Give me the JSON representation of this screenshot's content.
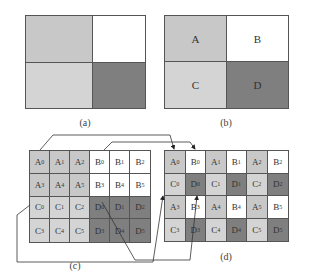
{
  "colors": {
    "A": "#c8c8c8",
    "B": "#ffffff",
    "C": "#d4d4d4",
    "D": "#7f7f7f",
    "border": "#555555"
  },
  "panel_a": {
    "caption": "(a)",
    "cells": [
      "",
      "",
      "",
      ""
    ],
    "types": [
      "A",
      "B",
      "C",
      "D"
    ]
  },
  "panel_b": {
    "caption": "(b)",
    "cells": [
      "A",
      "B",
      "C",
      "D"
    ],
    "types": [
      "A",
      "B",
      "C",
      "D"
    ]
  },
  "panel_c": {
    "caption": "(c)",
    "rows": [
      [
        "A0",
        "A1",
        "A2",
        "B0",
        "B1",
        "B2"
      ],
      [
        "A3",
        "A4",
        "A5",
        "B3",
        "B4",
        "B5"
      ],
      [
        "C0",
        "C1",
        "C2",
        "D0",
        "D1",
        "D2"
      ],
      [
        "C3",
        "C4",
        "C5",
        "D3",
        "D4",
        "D5"
      ]
    ]
  },
  "panel_d": {
    "caption": "(d)",
    "rows": [
      [
        "A0",
        "B0",
        "A1",
        "B1",
        "A2",
        "B2"
      ],
      [
        "C0",
        "D0",
        "C1",
        "D1",
        "C2",
        "D2"
      ],
      [
        "A3",
        "B3",
        "A4",
        "B4",
        "A5",
        "B5"
      ],
      [
        "C3",
        "D3",
        "C4",
        "D4",
        "C5",
        "D5"
      ]
    ]
  }
}
